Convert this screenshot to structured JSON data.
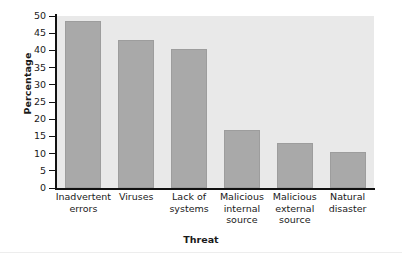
{
  "chart_data": {
    "type": "bar",
    "title": "",
    "xlabel": "Threat",
    "ylabel": "Percentage",
    "categories": [
      "Inadvertent errors",
      "Viruses",
      "Lack of systems",
      "Malicious internal source",
      "Malicious external source",
      "Natural disaster"
    ],
    "category_lines": [
      "Inadvertent\nerrors",
      "Viruses",
      "Lack of\nsystems",
      "Malicious\ninternal\nsource",
      "Malicious\nexternal\nsource",
      "Natural\ndisaster"
    ],
    "values": [
      48.5,
      43,
      40.5,
      17,
      13,
      10.5
    ],
    "ylim": [
      0,
      50
    ],
    "ytick_labels": [
      "50",
      "45",
      "40",
      "35",
      "30",
      "25",
      "20",
      "15",
      "10",
      "5",
      "0"
    ],
    "ytick_values": [
      50,
      45,
      40,
      35,
      30,
      25,
      20,
      15,
      10,
      5,
      0
    ],
    "grid": false,
    "legend": null,
    "bar_color": "#a9a9a9",
    "plot_background": "#e9e9e9",
    "figure_background": "#ffffff",
    "axis_color": "#111111"
  }
}
